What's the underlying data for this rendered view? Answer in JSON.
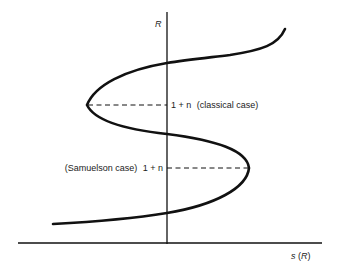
{
  "diagram": {
    "y_axis_label": "R",
    "x_axis_label": "s (R)",
    "upper_level": {
      "value_label": "1 + n",
      "case_label": "(classical case)"
    },
    "lower_level": {
      "case_label": "(Samuelson case)",
      "value_label": "1 + n"
    },
    "curve": "s(R) savings function, S-shaped curve crossing R-axis three times",
    "colors": {
      "ink": "#111111",
      "background": "#ffffff"
    }
  }
}
